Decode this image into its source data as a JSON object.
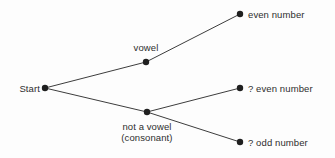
{
  "diagram": {
    "type": "probability-tree",
    "title": "",
    "background_color": "#fdfdfd",
    "line_color": "#3d3d3d",
    "node_color": "#1f1f1f",
    "text_color": "#2e2e2e",
    "nodes": [
      {
        "id": "start",
        "label": "Start",
        "x": 45,
        "y": 88,
        "label_x": 8,
        "label_y": 83,
        "label_width": 32,
        "label_align": "right"
      },
      {
        "id": "vowel",
        "label": "vowel",
        "x": 146,
        "y": 62,
        "label_x": 122,
        "label_y": 42,
        "label_width": 48,
        "label_align": "center"
      },
      {
        "id": "consonant",
        "label": "not a vowel\n(consonant)",
        "x": 147,
        "y": 112,
        "label_x": 104,
        "label_y": 121,
        "label_width": 86,
        "label_align": "center"
      },
      {
        "id": "even-number",
        "label": "even number",
        "x": 240,
        "y": 14,
        "label_x": 248,
        "label_y": 9,
        "label_width": 80,
        "label_align": "left"
      },
      {
        "id": "q-even-number",
        "label": "? even number",
        "x": 240,
        "y": 88,
        "label_x": 248,
        "label_y": 83,
        "label_width": 84,
        "label_align": "left"
      },
      {
        "id": "q-odd-number",
        "label": "? odd number",
        "x": 240,
        "y": 142,
        "label_x": 248,
        "label_y": 137,
        "label_width": 84,
        "label_align": "left"
      }
    ],
    "edges": [
      {
        "id": "start-to-vowel",
        "from": "start",
        "to": "vowel",
        "x1": 45,
        "y1": 88,
        "x2": 146,
        "y2": 62
      },
      {
        "id": "start-to-consonant",
        "from": "start",
        "to": "consonant",
        "x1": 45,
        "y1": 88,
        "x2": 147,
        "y2": 112
      },
      {
        "id": "vowel-to-even-number",
        "from": "vowel",
        "to": "even-number",
        "x1": 146,
        "y1": 62,
        "x2": 240,
        "y2": 14
      },
      {
        "id": "consonant-to-q-even-number",
        "from": "consonant",
        "to": "q-even-number",
        "x1": 147,
        "y1": 112,
        "x2": 240,
        "y2": 88
      },
      {
        "id": "consonant-to-q-odd-number",
        "from": "consonant",
        "to": "q-odd-number",
        "x1": 147,
        "y1": 112,
        "x2": 240,
        "y2": 142
      }
    ],
    "node_radius": 3.2
  }
}
